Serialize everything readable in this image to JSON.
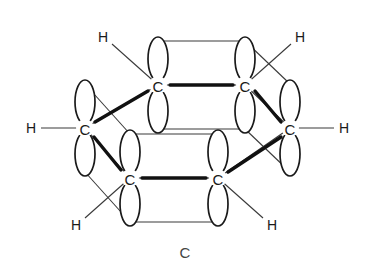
{
  "figure": {
    "caption": "C",
    "atom_symbol_carbon": "C",
    "atom_symbol_hydrogen": "H",
    "colors": {
      "stroke_dark": "#1a1a1a",
      "stroke_light": "#3a3a3a",
      "bond_front": "#111111",
      "background": "#ffffff",
      "caption": "#444444"
    },
    "carbons": [
      {
        "id": "c-top-left",
        "label": "C",
        "x": 158,
        "y": 85
      },
      {
        "id": "c-top-right",
        "label": "C",
        "x": 245,
        "y": 85
      },
      {
        "id": "c-left",
        "label": "C",
        "x": 85,
        "y": 128
      },
      {
        "id": "c-right",
        "label": "C",
        "x": 290,
        "y": 128
      },
      {
        "id": "c-bottom-left",
        "label": "C",
        "x": 130,
        "y": 178
      },
      {
        "id": "c-bottom-right",
        "label": "C",
        "x": 218,
        "y": 178
      }
    ],
    "hydrogens": [
      {
        "id": "h-top-left",
        "label": "H",
        "x": 103,
        "y": 37,
        "bond_to": "c-top-left",
        "bond_x": 150,
        "bond_y": 76
      },
      {
        "id": "h-top-right",
        "label": "H",
        "x": 300,
        "y": 37,
        "bond_to": "c-top-right",
        "bond_x": 253,
        "bond_y": 76
      },
      {
        "id": "h-left",
        "label": "H",
        "x": 31,
        "y": 128,
        "bond_to": "c-left",
        "bond_x": 76,
        "bond_y": 128
      },
      {
        "id": "h-right",
        "label": "H",
        "x": 344,
        "y": 128,
        "bond_to": "c-right",
        "bond_x": 299,
        "bond_y": 128
      },
      {
        "id": "h-bottom-left",
        "label": "H",
        "x": 76,
        "y": 225,
        "bond_to": "c-bottom-left",
        "bond_x": 122,
        "bond_y": 188
      },
      {
        "id": "h-bottom-right",
        "label": "H",
        "x": 272,
        "y": 225,
        "bond_to": "c-bottom-right",
        "bond_x": 226,
        "bond_y": 188
      }
    ],
    "ring_bonds": [
      {
        "id": "bond-topleft-topright",
        "from": "c-top-left",
        "to": "c-top-right",
        "type": "front"
      },
      {
        "id": "bond-left-topleft",
        "from": "c-left",
        "to": "c-top-left",
        "type": "front"
      },
      {
        "id": "bond-topright-right",
        "from": "c-top-right",
        "to": "c-right",
        "type": "front"
      },
      {
        "id": "bond-left-bottomleft",
        "from": "c-left",
        "to": "c-bottom-left",
        "type": "front"
      },
      {
        "id": "bond-bottomright-right",
        "from": "c-bottom-right",
        "to": "c-right",
        "type": "front"
      },
      {
        "id": "bond-bottomleft-bottomright",
        "from": "c-bottom-left",
        "to": "c-bottom-right",
        "type": "front"
      }
    ],
    "orbital": {
      "name": "p-orbital",
      "lobe_rx": 10,
      "lobe_ry": 22,
      "lobe_offset_y": 26,
      "orientation": "vertical",
      "count_per_carbon": 2
    },
    "overlap_rails": [
      {
        "id": "rail-upper-back",
        "x1": 158,
        "y1": 41,
        "x2": 245,
        "y2": 41
      },
      {
        "id": "rail-lower-back",
        "x1": 158,
        "y1": 129,
        "x2": 245,
        "y2": 129
      },
      {
        "id": "rail-upper-front",
        "x1": 130,
        "y1": 134,
        "x2": 218,
        "y2": 134
      },
      {
        "id": "rail-lower-front",
        "x1": 130,
        "y1": 222,
        "x2": 218,
        "y2": 222
      },
      {
        "id": "rail-left-upper",
        "x1": 85,
        "y1": 84,
        "x2": 130,
        "y2": 134
      },
      {
        "id": "rail-left-lower",
        "x1": 85,
        "y1": 172,
        "x2": 130,
        "y2": 222
      },
      {
        "id": "rail-right-upper",
        "x1": 290,
        "y1": 84,
        "x2": 245,
        "y2": 41
      },
      {
        "id": "rail-right-lower",
        "x1": 290,
        "y1": 172,
        "x2": 245,
        "y2": 129
      }
    ]
  }
}
